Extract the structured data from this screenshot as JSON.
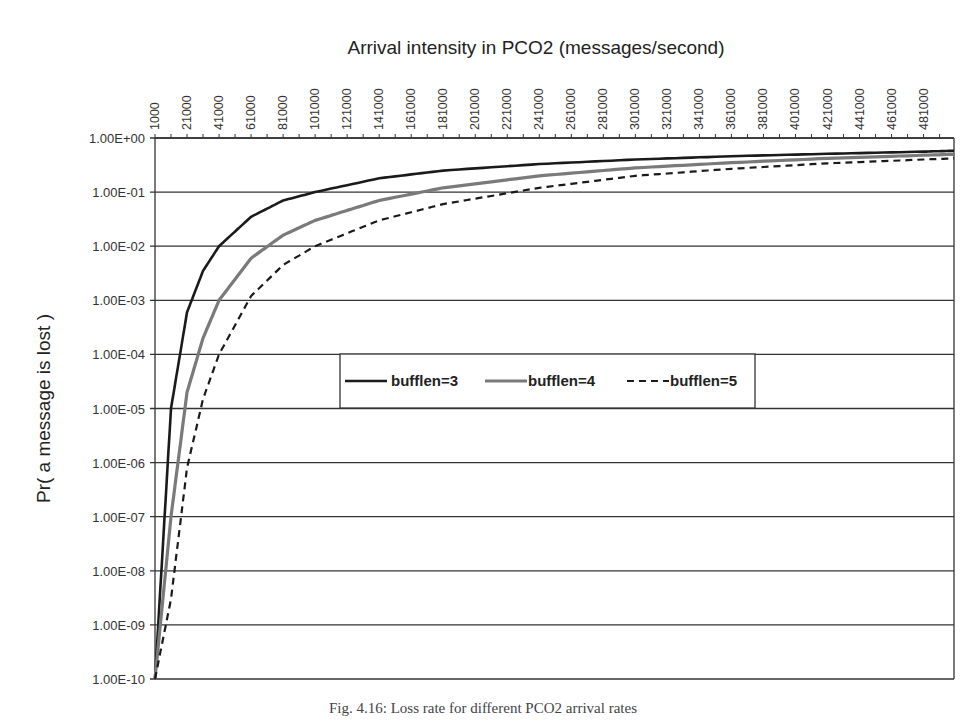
{
  "chart_data": {
    "type": "line",
    "title": "Arrival intensity in PCO2 (messages/second)",
    "xlabel": "Arrival intensity in PCO2 (messages/second)",
    "ylabel": "Pr( a message is lost )",
    "x_axis_position": "top",
    "y_scale": "log",
    "ylim": [
      1e-10,
      1
    ],
    "xlim": [
      1000,
      500000
    ],
    "grid": "horizontal",
    "legend_position": "center-inside",
    "x_tick_labels": [
      "1000",
      "21000",
      "41000",
      "61000",
      "81000",
      "101000",
      "121000",
      "141000",
      "161000",
      "181000",
      "201000",
      "221000",
      "241000",
      "261000",
      "281000",
      "301000",
      "321000",
      "341000",
      "361000",
      "381000",
      "401000",
      "421000",
      "441000",
      "461000",
      "481000"
    ],
    "y_tick_labels": [
      "1.00E+00",
      "1.00E-01",
      "1.00E-02",
      "1.00E-03",
      "1.00E-04",
      "1.00E-05",
      "1.00E-06",
      "1.00E-07",
      "1.00E-08",
      "1.00E-09",
      "1.00E-10"
    ],
    "x": [
      1000,
      11000,
      21000,
      31000,
      41000,
      61000,
      81000,
      101000,
      141000,
      181000,
      241000,
      301000,
      361000,
      421000,
      481000,
      500000
    ],
    "series": [
      {
        "name": "bufflen=3",
        "style": "solid-black",
        "values": [
          1e-10,
          1e-05,
          0.0006,
          0.0035,
          0.01,
          0.035,
          0.07,
          0.1,
          0.18,
          0.25,
          0.33,
          0.4,
          0.46,
          0.51,
          0.56,
          0.58
        ]
      },
      {
        "name": "bufflen=4",
        "style": "solid-gray",
        "values": [
          1e-10,
          1e-07,
          2e-05,
          0.0002,
          0.001,
          0.006,
          0.016,
          0.03,
          0.07,
          0.12,
          0.2,
          0.28,
          0.35,
          0.42,
          0.48,
          0.5
        ]
      },
      {
        "name": "bufflen=5",
        "style": "dashed-black",
        "values": [
          1e-10,
          3e-09,
          8e-07,
          1.5e-05,
          0.0001,
          0.0012,
          0.0045,
          0.01,
          0.03,
          0.06,
          0.12,
          0.2,
          0.27,
          0.34,
          0.4,
          0.42
        ]
      }
    ]
  },
  "legend": {
    "items": [
      {
        "label": "bufflen=3"
      },
      {
        "label": "bufflen=4"
      },
      {
        "label": "bufflen=5"
      }
    ]
  },
  "caption": "Fig. 4.16: Loss rate for different PCO2 arrival rates"
}
